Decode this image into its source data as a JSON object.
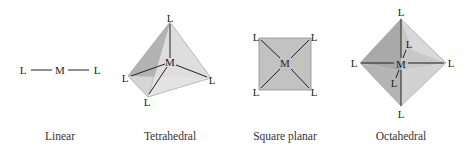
{
  "figure": {
    "geometries": [
      {
        "id": "linear",
        "caption": "Linear",
        "metal": "M",
        "ligands": [
          "L",
          "L"
        ]
      },
      {
        "id": "tetrahedral",
        "caption": "Tetrahedral",
        "metal": "M",
        "ligands": [
          "L",
          "L",
          "L",
          "L"
        ]
      },
      {
        "id": "square-planar",
        "caption": "Square planar",
        "metal": "M",
        "ligands": [
          "L",
          "L",
          "L",
          "L"
        ]
      },
      {
        "id": "octahedral",
        "caption": "Octahedral",
        "metal": "M",
        "ligands": [
          "L",
          "L",
          "L",
          "L",
          "L",
          "L"
        ]
      }
    ],
    "colors": {
      "face_light": "#d6d6d6",
      "face_mid": "#bdbdbd",
      "face_dark": "#a8a8a8",
      "bond": "#222222",
      "square_fill": "#c4c4c4"
    }
  }
}
